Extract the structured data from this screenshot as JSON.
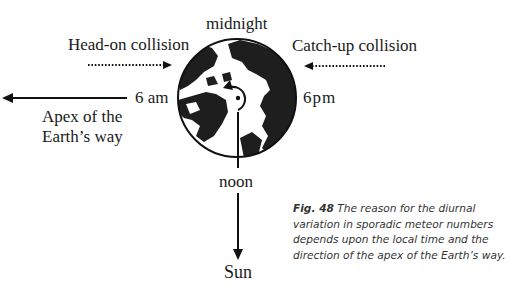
{
  "diagram": {
    "top_label": "midnight",
    "bottom_label": "noon",
    "left_time_label": "6 am",
    "right_time_label": "6pm",
    "head_on_label": "Head-on collision",
    "catch_up_label": "Catch-up collision",
    "apex_label_line1": "Apex of the",
    "apex_label_line2": "Earth’s way",
    "sun_label": "Sun",
    "icons": [
      "globe-north-pole-icon",
      "rotation-arrow-icon",
      "arrow-left-icon",
      "arrow-down-icon",
      "dotted-arrow-right-icon",
      "dotted-arrow-left-icon"
    ]
  },
  "caption": {
    "fig_label": "Fig. 48",
    "text": " The reason for the diurnal variation in sporadic meteor numbers depends upon the local time and the direction of the apex of the Earth’s way."
  }
}
